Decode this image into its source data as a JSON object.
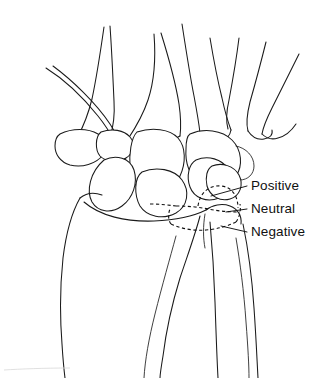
{
  "figure": {
    "kind": "line-drawing",
    "background_color": "#ffffff",
    "ink_color": "#1a1a1a",
    "width": 314,
    "height": 378
  },
  "labels": {
    "positive": "Positive",
    "neutral": "Neutral",
    "negative": "Negative"
  },
  "label_positions": {
    "positive": {
      "x": 251,
      "y": 186
    },
    "neutral": {
      "x": 251,
      "y": 209
    },
    "negative": {
      "x": 251,
      "y": 232
    }
  },
  "leader_lines": {
    "positive": {
      "x1": 247,
      "y1": 186,
      "x2": 211,
      "y2": 196
    },
    "neutral": {
      "x1": 247,
      "y1": 209,
      "x2": 226,
      "y2": 212
    },
    "negative": {
      "x1": 247,
      "y1": 232,
      "x2": 221,
      "y2": 226
    }
  },
  "anatomy": {
    "metacarpals": [
      "first-metacarpal",
      "second-metacarpal",
      "third-metacarpal",
      "fourth-metacarpal",
      "fifth-metacarpal"
    ],
    "carpal_bones": [
      "trapezium",
      "trapezoid",
      "scaphoid",
      "capitate",
      "lunate",
      "hamate",
      "triquetrum",
      "pisiform"
    ],
    "forearm_bones": [
      "radius",
      "ulna"
    ]
  },
  "variance_levels": [
    {
      "name": "Positive",
      "description": "ulna projects distal to radius articular surface"
    },
    {
      "name": "Neutral",
      "description": "ulna level with radius articular surface"
    },
    {
      "name": "Negative",
      "description": "ulna proximal to radius articular surface"
    }
  ]
}
